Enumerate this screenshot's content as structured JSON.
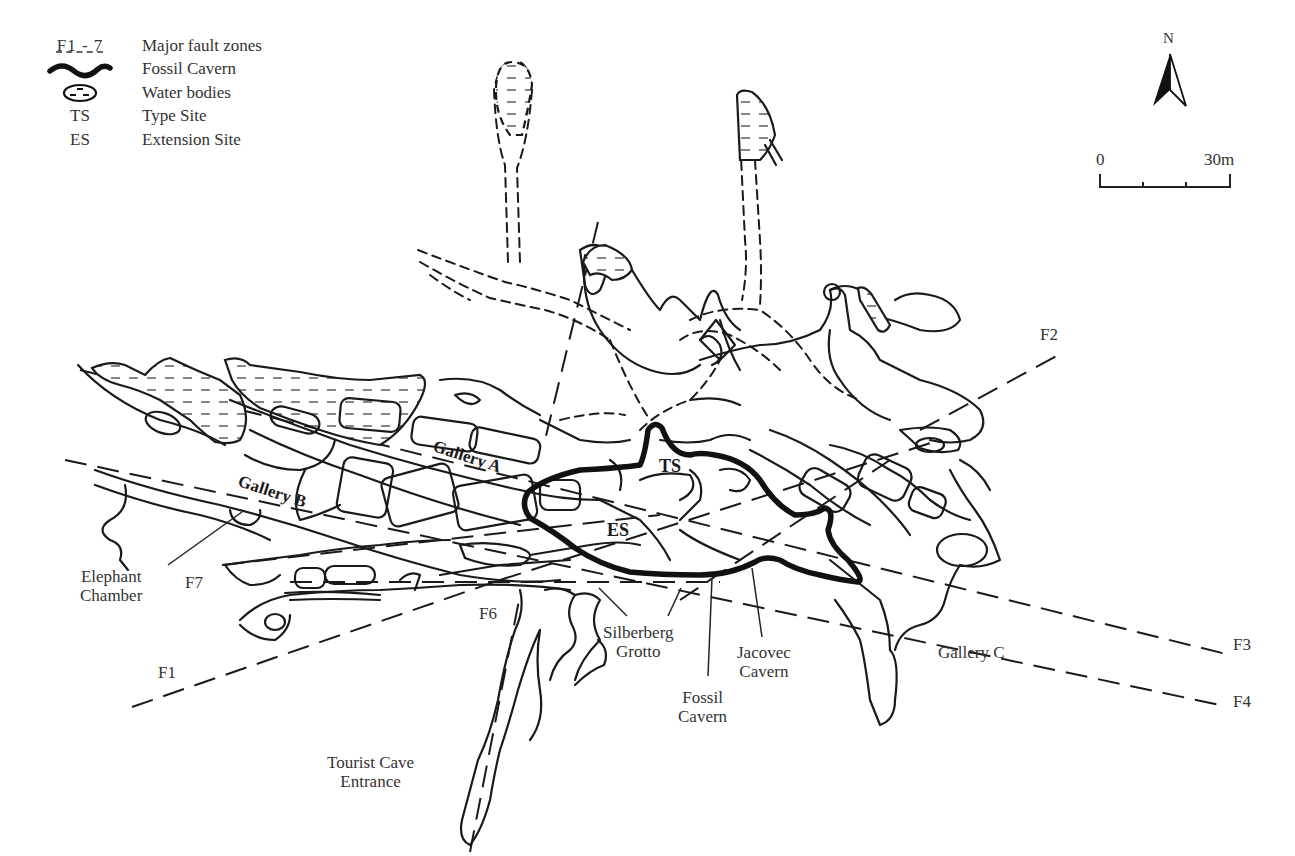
{
  "legend": {
    "items": [
      {
        "symbol": "F1 - 7",
        "symbol_type": "dashed-underline",
        "label": "Major fault zones"
      },
      {
        "symbol": "",
        "symbol_type": "thick-wavy-line",
        "label": "Fossil Cavern"
      },
      {
        "symbol": "",
        "symbol_type": "oval-with-dashes",
        "label": "Water bodies"
      },
      {
        "symbol": "TS",
        "symbol_type": "text",
        "label": "Type Site"
      },
      {
        "symbol": "ES",
        "symbol_type": "text",
        "label": "Extension Site"
      }
    ]
  },
  "north_arrow": {
    "label": "N",
    "icon": "north-arrow-icon"
  },
  "scale_bar": {
    "start_label": "0",
    "end_label": "30m",
    "ticks": 4
  },
  "faults": [
    {
      "id": "F1",
      "label": "F1"
    },
    {
      "id": "F2",
      "label": "F2"
    },
    {
      "id": "F3",
      "label": "F3"
    },
    {
      "id": "F4",
      "label": "F4"
    },
    {
      "id": "F6",
      "label": "F6"
    },
    {
      "id": "F7",
      "label": "F7"
    }
  ],
  "labels": {
    "gallery_a": "Gallery A",
    "gallery_b": "Gallery B",
    "gallery_c": "Gallery C",
    "ts": "TS",
    "es": "ES",
    "elephant_chamber": [
      "Elephant",
      "Chamber"
    ],
    "silberberg_grotto": [
      "Silberberg",
      "Grotto"
    ],
    "jacovec_cavern": [
      "Jacovec",
      "Cavern"
    ],
    "fossil_cavern": [
      "Fossil",
      "Cavern"
    ],
    "tourist_cave_entrance": [
      "Tourist Cave",
      "Entrance"
    ]
  },
  "colors": {
    "line": "#1a1a1a",
    "text": "#333333",
    "background": "#ffffff"
  }
}
